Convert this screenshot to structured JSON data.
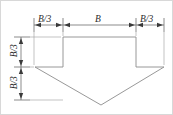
{
  "figure": {
    "shape_name": "down-arrow",
    "stroke_color": "#808080",
    "fill_color": "#ffffff",
    "text_color": "#2b2b2b",
    "border_color": "#d8d8d8",
    "background_color": "#ffffff"
  },
  "horizontal_dimensions": [
    {
      "id": "left-barb-width",
      "label": "B/3"
    },
    {
      "id": "shaft-width",
      "label": "B"
    },
    {
      "id": "right-barb-width",
      "label": "B/3"
    }
  ],
  "vertical_dimensions": [
    {
      "id": "shaft-height",
      "label": "B/3"
    },
    {
      "id": "head-height",
      "label": "B/3"
    }
  ],
  "geometry": {
    "shaft_left_x": 62,
    "shaft_right_x": 135,
    "shaft_top_y": 36,
    "barb_left_x": 34,
    "barb_right_x": 163,
    "barb_y": 66,
    "tip_x": 100,
    "tip_y": 104,
    "top_dim_line_y": 24,
    "left_dim_line_x": 20
  }
}
